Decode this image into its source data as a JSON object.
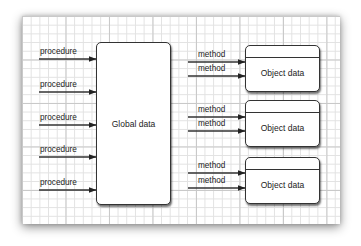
{
  "diagram": {
    "global_box": {
      "label": "Global data"
    },
    "procedures": [
      {
        "label": "procedure"
      },
      {
        "label": "procedure"
      },
      {
        "label": "procedure"
      },
      {
        "label": "procedure"
      },
      {
        "label": "procedure"
      }
    ],
    "objects": [
      {
        "label": "Object data",
        "methods": [
          {
            "label": "method"
          },
          {
            "label": "method"
          }
        ]
      },
      {
        "label": "Object data",
        "methods": [
          {
            "label": "method"
          },
          {
            "label": "method"
          }
        ]
      },
      {
        "label": "Object data",
        "methods": [
          {
            "label": "method"
          },
          {
            "label": "method"
          }
        ]
      }
    ],
    "colors": {
      "line": "#333333",
      "grid_minor": "#e2e2e2",
      "grid_major": "#c9c9c9",
      "paper": "#ffffff"
    }
  }
}
